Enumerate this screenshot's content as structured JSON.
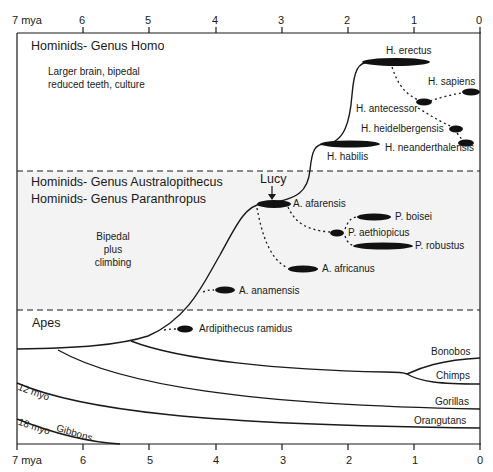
{
  "axis": {
    "unit_label": "7 mya",
    "ticks": [
      "6",
      "5",
      "4",
      "3",
      "2",
      "1",
      "0"
    ],
    "bottom_unit_label": "7 mya",
    "bottom_ticks": [
      "6",
      "5",
      "4",
      "3",
      "2",
      "1",
      "0"
    ]
  },
  "zones": {
    "homo": {
      "title": "Hominids- Genus Homo",
      "desc_line1": "Larger brain, bipedal",
      "desc_line2": "reduced teeth, culture"
    },
    "australopithecus": {
      "title1": "Hominids- Genus Australopithecus",
      "title2": "Hominids- Genus Paranthropus",
      "desc_line1": "Bipedal",
      "desc_line2": "plus",
      "desc_line3": "climbing"
    },
    "apes": {
      "title": "Apes"
    }
  },
  "species": {
    "h_erectus": "H. erectus",
    "h_sapiens": "H. sapiens",
    "h_antecessor": "H. antecessor",
    "h_heidelbergensis": "H. heidelbergensis",
    "h_neanderthalensis": "H. neanderthalensis",
    "h_habilis": "H. habilis",
    "lucy": "Lucy",
    "a_afarensis": "A. afarensis",
    "p_boisei": "P. boisei",
    "p_aethiopicus": "P. aethiopicus",
    "p_robustus": "P. robustus",
    "a_africanus": "A. africanus",
    "a_anamensis": "A. anamensis",
    "ardipithecus": "Ardipithecus ramidus"
  },
  "apes": {
    "bonobos": "Bonobos",
    "chimps": "Chimps",
    "gorillas": "Gorillas",
    "orangutans": "Orangutans",
    "gibbons": "Gibbons",
    "split_12": "12 myo",
    "split_18": "18 myo"
  },
  "colors": {
    "line": "#1a1a1a",
    "shaded_band": "#f3f3f3",
    "background": "#ffffff"
  }
}
